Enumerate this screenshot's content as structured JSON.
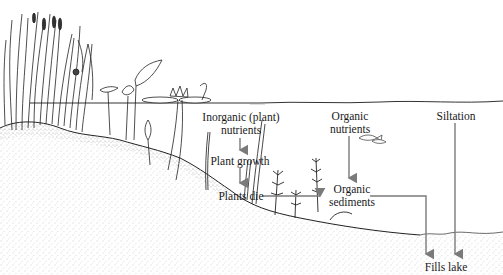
{
  "diagram": {
    "colors": {
      "arrow": "#7a7a7a",
      "ink": "#1a1a1a",
      "sediment": "#bdbdbd",
      "water_line": "#333333"
    },
    "labels": {
      "inorganic_nutrients": "Inorganic (plant)",
      "inorganic_nutrients_line2": "nutrients",
      "plant_growth": "Plant growth",
      "plants_die": "Plants die",
      "organic_nutrients": "Organic",
      "organic_nutrients_line2": "nutrients",
      "organic_sediments": "Organic",
      "organic_sediments_line2": "sediments",
      "siltation": "Siltation",
      "fills_lake": "Fills lake"
    },
    "flows": [
      {
        "from": "Inorganic (plant) nutrients",
        "to": "Plant growth"
      },
      {
        "from": "Plant growth",
        "to": "Plants die"
      },
      {
        "from": "Plants die",
        "to": "Organic sediments"
      },
      {
        "from": "Organic nutrients",
        "to": "Organic sediments"
      },
      {
        "from": "Organic sediments",
        "to": "Fills lake"
      },
      {
        "from": "Siltation",
        "to": "Fills lake"
      }
    ]
  }
}
